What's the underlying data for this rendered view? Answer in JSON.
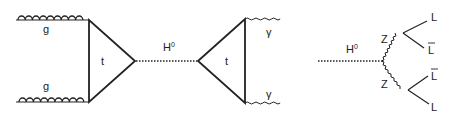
{
  "diagram_left": {
    "title": "gluon fusion to Higgs to diphoton",
    "labels": {
      "gluon_top": "g",
      "gluon_bottom": "g",
      "top_loop_1": "t",
      "higgs": "H",
      "higgs_sup": "0",
      "top_loop_2": "t",
      "photon_top": "γ",
      "photon_bottom": "γ"
    }
  },
  "diagram_right": {
    "title": "Higgs to ZZ to four leptons",
    "labels": {
      "higgs": "H",
      "higgs_sup": "0",
      "z_top": "Z",
      "z_bottom": "Z",
      "lepton_1": "L",
      "lepton_2": "L",
      "lepton_3": "L",
      "lepton_4": "L"
    }
  },
  "colors": {
    "line": "#222222",
    "background": "#ffffff"
  }
}
